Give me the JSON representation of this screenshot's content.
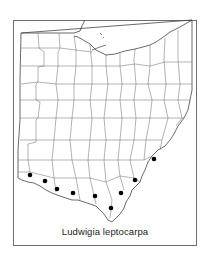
{
  "map": {
    "region": "Ohio",
    "caption": "Ludwigia leptocarpa",
    "marker_color": "#000000",
    "line_color": "#555555",
    "frame_color": "#6e6e6e",
    "occurrence_count": 9,
    "occurrences": [
      {
        "x": 30,
        "y": 175
      },
      {
        "x": 45,
        "y": 181
      },
      {
        "x": 57,
        "y": 189
      },
      {
        "x": 73,
        "y": 193
      },
      {
        "x": 95,
        "y": 196
      },
      {
        "x": 111,
        "y": 208
      },
      {
        "x": 121,
        "y": 193
      },
      {
        "x": 135,
        "y": 180
      },
      {
        "x": 154,
        "y": 159
      }
    ]
  }
}
